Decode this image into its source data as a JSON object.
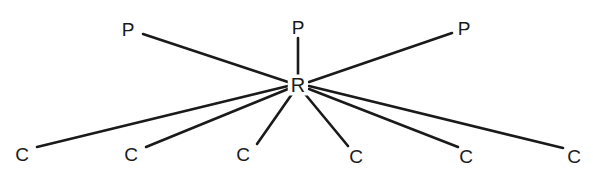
{
  "diagram": {
    "type": "radial-bond-diagram",
    "title": "",
    "background_color": "#ffffff",
    "line_color": "#1a1a1a",
    "text_color": "#1a1a1a",
    "center": {
      "label": "R",
      "x": 298,
      "y": 85
    },
    "nodes": [
      {
        "id": "p-left",
        "label": "P",
        "x": 128,
        "y": 29,
        "group": "P"
      },
      {
        "id": "p-center",
        "label": "P",
        "x": 298,
        "y": 27,
        "group": "P"
      },
      {
        "id": "p-right",
        "label": "P",
        "x": 464,
        "y": 28,
        "group": "P"
      },
      {
        "id": "c-1",
        "label": "C",
        "x": 22,
        "y": 154,
        "group": "C"
      },
      {
        "id": "c-2",
        "label": "C",
        "x": 131,
        "y": 154,
        "group": "C"
      },
      {
        "id": "c-3",
        "label": "C",
        "x": 243,
        "y": 154,
        "group": "C"
      },
      {
        "id": "c-4",
        "label": "C",
        "x": 356,
        "y": 156,
        "group": "C"
      },
      {
        "id": "c-5",
        "label": "C",
        "x": 466,
        "y": 156,
        "group": "C"
      },
      {
        "id": "c-6",
        "label": "C",
        "x": 574,
        "y": 156,
        "group": "C"
      }
    ],
    "bonds": [
      {
        "id": "bond-p-left",
        "from": "center",
        "to": "p-left",
        "x1": 288,
        "y1": 82,
        "x2": 143,
        "y2": 34
      },
      {
        "id": "bond-p-center",
        "from": "center",
        "to": "p-center",
        "x1": 298,
        "y1": 75,
        "x2": 298,
        "y2": 38
      },
      {
        "id": "bond-p-right",
        "from": "center",
        "to": "p-right",
        "x1": 309,
        "y1": 82,
        "x2": 452,
        "y2": 33
      },
      {
        "id": "bond-c-1",
        "from": "center",
        "to": "c-1",
        "x1": 288,
        "y1": 86,
        "x2": 37,
        "y2": 147
      },
      {
        "id": "bond-c-2",
        "from": "center",
        "to": "c-2",
        "x1": 288,
        "y1": 89,
        "x2": 146,
        "y2": 147
      },
      {
        "id": "bond-c-3",
        "from": "center",
        "to": "c-3",
        "x1": 292,
        "y1": 94,
        "x2": 257,
        "y2": 144
      },
      {
        "id": "bond-c-4",
        "from": "center",
        "to": "c-4",
        "x1": 305,
        "y1": 94,
        "x2": 348,
        "y2": 146
      },
      {
        "id": "bond-c-5",
        "from": "center",
        "to": "c-5",
        "x1": 309,
        "y1": 89,
        "x2": 458,
        "y2": 147
      },
      {
        "id": "bond-c-6",
        "from": "center",
        "to": "c-6",
        "x1": 309,
        "y1": 86,
        "x2": 563,
        "y2": 148
      }
    ]
  }
}
